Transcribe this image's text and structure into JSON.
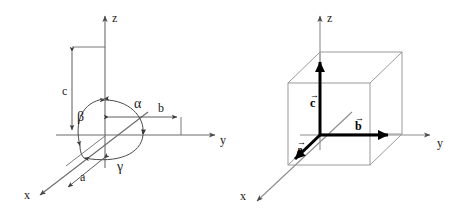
{
  "figure": {
    "panels": [
      {
        "id": "left",
        "name": "lattice-parameters-and-angles",
        "axes": [
          {
            "name": "z-axis",
            "label": "z"
          },
          {
            "name": "y-axis",
            "label": "y"
          },
          {
            "name": "x-axis",
            "label": "x"
          }
        ],
        "lengths": [
          {
            "name": "length-a",
            "label": "a"
          },
          {
            "name": "length-b",
            "label": "b"
          },
          {
            "name": "length-c",
            "label": "c"
          }
        ],
        "angles": [
          {
            "name": "angle-alpha",
            "label": "α"
          },
          {
            "name": "angle-beta",
            "label": "β"
          },
          {
            "name": "angle-gamma",
            "label": "γ"
          }
        ]
      },
      {
        "id": "right",
        "name": "unit-cell-cube-with-vectors",
        "axes": [
          {
            "name": "z-axis",
            "label": "z"
          },
          {
            "name": "y-axis",
            "label": "y"
          },
          {
            "name": "x-axis",
            "label": "x"
          }
        ],
        "vectors": [
          {
            "name": "vector-a",
            "label": "a",
            "overbar": "→"
          },
          {
            "name": "vector-b",
            "label": "b",
            "overbar": "→"
          },
          {
            "name": "vector-c",
            "label": "c",
            "overbar": "→"
          }
        ]
      }
    ],
    "colors": {
      "background": "#ffffff",
      "axis_line": "#6b6b6b",
      "cube_edge": "#9a9a9a",
      "vector": "#000000",
      "text": "#1a1a1a"
    }
  }
}
